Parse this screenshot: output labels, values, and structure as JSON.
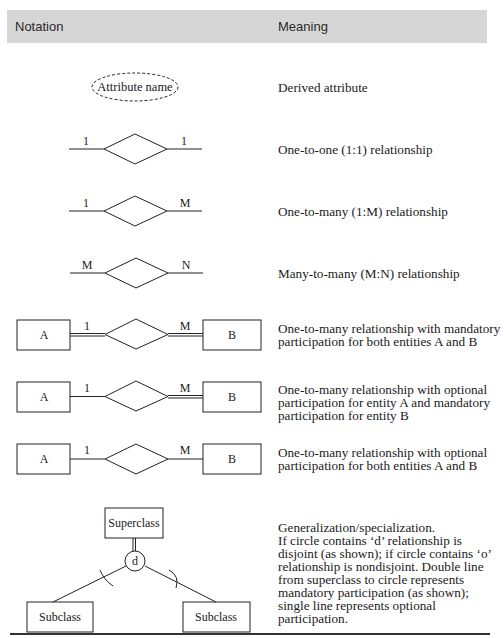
{
  "header": {
    "notation": "Notation",
    "meaning": "Meaning"
  },
  "rows": [
    {
      "notation": {
        "type": "derived-attribute",
        "label": "Attribute name"
      },
      "meaning": "Derived attribute"
    },
    {
      "notation": {
        "type": "relationship",
        "left": "1",
        "right": "1"
      },
      "meaning": "One-to-one (1:1) relationship"
    },
    {
      "notation": {
        "type": "relationship",
        "left": "1",
        "right": "M"
      },
      "meaning": "One-to-many (1:M) relationship"
    },
    {
      "notation": {
        "type": "relationship",
        "left": "M",
        "right": "N"
      },
      "meaning": "Many-to-many (M:N) relationship"
    },
    {
      "notation": {
        "type": "entity-relationship",
        "entity_left": "A",
        "entity_right": "B",
        "left": "1",
        "right": "M",
        "left_line": "double",
        "right_line": "double"
      },
      "meaning": "One-to-many relationship with mandatory\nparticipation for both entities A and B"
    },
    {
      "notation": {
        "type": "entity-relationship",
        "entity_left": "A",
        "entity_right": "B",
        "left": "1",
        "right": "M",
        "left_line": "single",
        "right_line": "double"
      },
      "meaning": "One-to-many relationship with optional\nparticipation for entity A and mandatory\nparticipation for entity B"
    },
    {
      "notation": {
        "type": "entity-relationship",
        "entity_left": "A",
        "entity_right": "B",
        "left": "1",
        "right": "M",
        "left_line": "single",
        "right_line": "single"
      },
      "meaning": "One-to-many relationship with optional\nparticipation for both entities A and B"
    },
    {
      "notation": {
        "type": "generalization",
        "superclass": "Superclass",
        "circle": "d",
        "subclass_left": "Subclass",
        "subclass_right": "Subclass"
      },
      "meaning": "Generalization/specialization.\nIf circle contains ‘d’ relationship is\ndisjoint (as shown); if circle contains ‘o’\nrelationship is nondisjoint. Double line\nfrom superclass to circle represents\nmandatory participation (as shown);\nsingle line represents optional\nparticipation."
    }
  ]
}
